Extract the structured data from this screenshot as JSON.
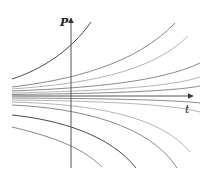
{
  "figure": {
    "type": "solution-curves",
    "axes": {
      "vertical": {
        "label": "P"
      },
      "horizontal": {
        "label": "t"
      }
    },
    "colors": {
      "axis": "#555555",
      "curve_dark": "#4a4a4a",
      "curve_mid": "#8a8a8a",
      "curve_light": "#b5b5b5"
    },
    "curves_above": [
      {
        "id": "u1",
        "shade": "curve_dark",
        "path": "M12,79 C40,70 70,52 91,22"
      },
      {
        "id": "u2",
        "shade": "curve_mid",
        "path": "M12,87 C70,80 135,65 175,23"
      },
      {
        "id": "u3",
        "shade": "curve_light",
        "path": "M12,89 C80,84 150,74 188,36"
      },
      {
        "id": "u4",
        "shade": "curve_mid",
        "path": "M12,91 C90,88 160,82 200,63"
      },
      {
        "id": "u5",
        "shade": "curve_light",
        "path": "M12,93 C100,91 170,87 200,77"
      },
      {
        "id": "u6",
        "shade": "curve_mid",
        "path": "M12,94.5 C110,93.5 175,91 200,86"
      }
    ],
    "curves_below": [
      {
        "id": "d1",
        "shade": "curve_mid",
        "path": "M12,98 C110,98.5 175,100 200,103"
      },
      {
        "id": "d2",
        "shade": "curve_light",
        "path": "M12,100 C100,101 170,104 200,112"
      },
      {
        "id": "d3",
        "shade": "curve_light",
        "path": "M12,102 C90,104 160,115 190,152"
      },
      {
        "id": "d4",
        "shade": "curve_mid",
        "path": "M12,105 C80,108 150,125 177,168"
      },
      {
        "id": "d5",
        "shade": "curve_dark",
        "path": "M12,115 C60,120 110,135 136,168"
      },
      {
        "id": "d6",
        "shade": "curve_mid",
        "path": "M12,127 C45,135 80,145 102,167"
      }
    ]
  }
}
